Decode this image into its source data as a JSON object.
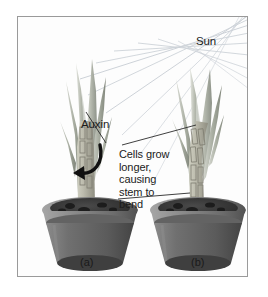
{
  "figure": {
    "type": "biology-diagram",
    "topic": "phototropism",
    "background_color": "#ffffff",
    "border_color": "#9a9a9a"
  },
  "annotations": {
    "sun": "Sun",
    "auxin": "Auxin",
    "cells_grow": "Cells grow\nlonger,\ncausing\nstem to\nbend"
  },
  "panels": [
    {
      "id": "a",
      "label": "(a)",
      "description": "upright plant with auxin distribution"
    },
    {
      "id": "b",
      "label": "(b)",
      "description": "plant bending toward sunlight"
    }
  ],
  "colors": {
    "leaf": "#b9bdb2",
    "leaf_dark": "#8d9288",
    "stem": "#b6b5a6",
    "pot_rim": "#8e8e8e",
    "pot_body": "#6e6e6e",
    "soil": "#3b3b3b",
    "ray": "#d2d6dc",
    "arrow": "#101010",
    "text": "#1b1b1b"
  }
}
